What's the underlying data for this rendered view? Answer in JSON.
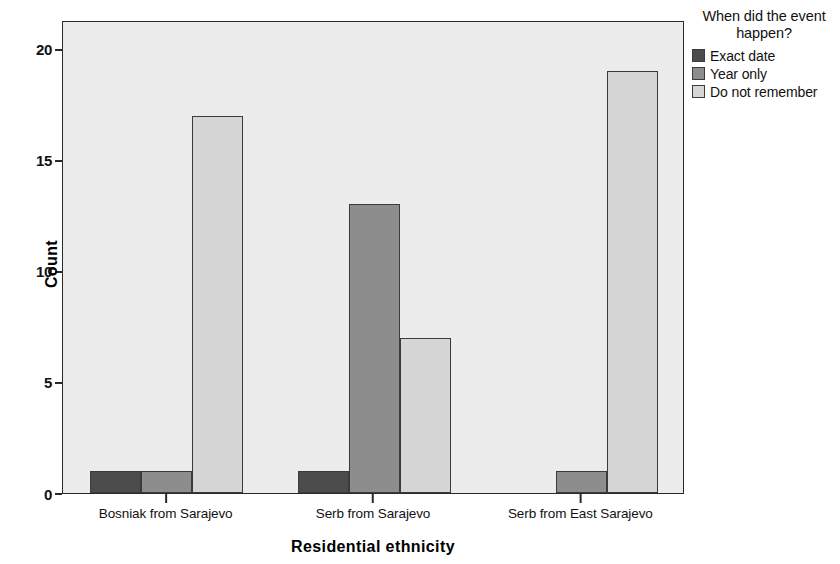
{
  "chart_data": {
    "type": "bar",
    "title": "",
    "subtitle": "",
    "xlabel": "Residential ethnicity",
    "ylabel": "Count",
    "categories": [
      "Bosniak from Sarajevo",
      "Serb from Sarajevo",
      "Serb from East Sarajevo"
    ],
    "series": [
      {
        "name": "Exact date",
        "color": "#4c4c4c",
        "values": [
          1,
          1,
          0
        ]
      },
      {
        "name": "Year only",
        "color": "#8d8d8d",
        "values": [
          1,
          13,
          1
        ]
      },
      {
        "name": "Do not remember",
        "color": "#d6d6d6",
        "values": [
          17,
          7,
          19
        ]
      }
    ],
    "ylim": [
      0,
      21.3
    ],
    "yticks": [
      0,
      5,
      10,
      15,
      20
    ],
    "ytick_labels": [
      "0",
      "5",
      "10",
      "15",
      "20"
    ],
    "grid": false,
    "legend": {
      "title": "When did the event happen?",
      "position": "right-top",
      "entries": [
        "Exact date",
        "Year only",
        "Do not remember"
      ]
    },
    "plot_background": "#ececec",
    "figure_background": "#ffffff",
    "bar_outline": "#3b3b3b"
  }
}
